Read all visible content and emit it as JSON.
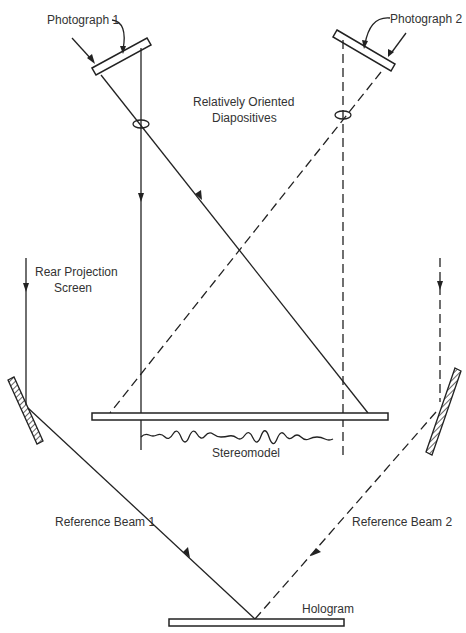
{
  "diagram": {
    "type": "optical-setup",
    "labels": {
      "photograph1": "Photograph 1",
      "photograph2": "Photograph 2",
      "diapositives_line1": "Relatively Oriented",
      "diapositives_line2": "Diapositives",
      "rear_screen_line1": "Rear Projection",
      "rear_screen_line2": "Screen",
      "stereomodel": "Stereomodel",
      "reference_beam1": "Reference Beam 1",
      "reference_beam2": "Reference Beam 2",
      "hologram": "Hologram"
    },
    "line_styles": {
      "photograph1_rays": "solid",
      "photograph2_rays": "dashed",
      "reference_beam1": "solid",
      "reference_beam2": "dashed"
    },
    "colors": {
      "line": "#222222",
      "text": "#333333",
      "background": "#ffffff"
    }
  }
}
